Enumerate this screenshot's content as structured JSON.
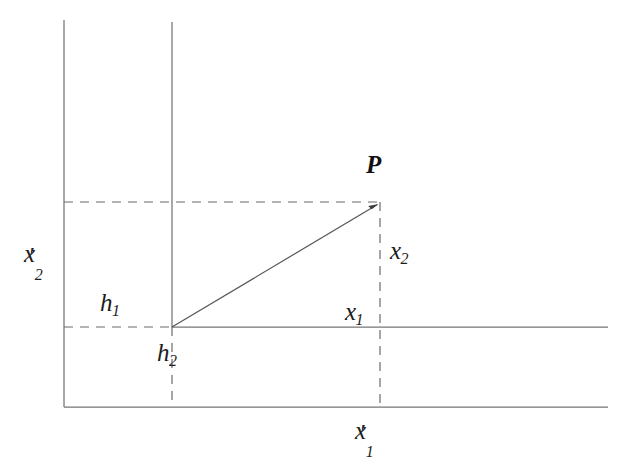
{
  "figure": {
    "background_color": "#ffffff",
    "line_color": "#6e6e6e",
    "dash_color": "#6b6b6b",
    "vector_color": "#55555a",
    "text_color": "#1c1c1c"
  },
  "labels": {
    "point": {
      "name": "P",
      "text": "P"
    },
    "x2_primed": {
      "base": "x",
      "prime": "′",
      "sub": "2"
    },
    "x1_primed": {
      "base": "x",
      "prime": "′",
      "sub": "1"
    },
    "x1": {
      "base": "x",
      "sub": "1"
    },
    "x2": {
      "base": "x",
      "sub": "2"
    },
    "h1": {
      "base": "h",
      "sub": "1"
    },
    "h2": {
      "base": "h",
      "sub": "2"
    }
  },
  "geometry": {
    "outer_origin_x": 64,
    "outer_origin_y": 407,
    "inner_origin_x": 172,
    "inner_origin_y": 327,
    "point_x": 380,
    "point_y": 202,
    "right_edge_x": 608,
    "outer_axis_top_y": 20,
    "inner_axis_top_y": 22
  }
}
